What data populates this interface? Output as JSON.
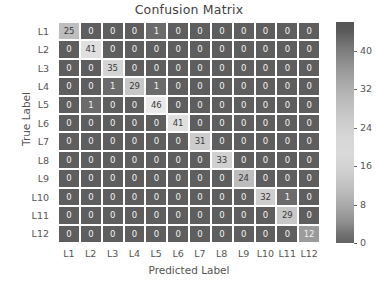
{
  "chart_data": {
    "type": "heatmap",
    "title": "Confusion Matrix",
    "xlabel": "Predicted Label",
    "ylabel": "True Label",
    "categories_x": [
      "L1",
      "L2",
      "L3",
      "L4",
      "L5",
      "L6",
      "L7",
      "L8",
      "L9",
      "L10",
      "L11",
      "L12"
    ],
    "categories_y": [
      "L1",
      "L2",
      "L3",
      "L4",
      "L5",
      "L6",
      "L7",
      "L8",
      "L9",
      "L10",
      "L11",
      "L12"
    ],
    "values": [
      [
        25,
        0,
        0,
        0,
        1,
        0,
        0,
        0,
        0,
        0,
        0,
        0
      ],
      [
        0,
        41,
        0,
        0,
        0,
        0,
        0,
        0,
        0,
        0,
        0,
        0
      ],
      [
        0,
        0,
        35,
        0,
        0,
        0,
        0,
        0,
        0,
        0,
        0,
        0
      ],
      [
        0,
        0,
        1,
        29,
        1,
        0,
        0,
        0,
        0,
        0,
        0,
        0
      ],
      [
        0,
        1,
        0,
        0,
        46,
        0,
        0,
        0,
        0,
        0,
        0,
        0
      ],
      [
        0,
        0,
        0,
        0,
        0,
        41,
        0,
        0,
        0,
        0,
        0,
        0
      ],
      [
        0,
        0,
        0,
        0,
        0,
        0,
        31,
        0,
        0,
        0,
        0,
        0
      ],
      [
        0,
        0,
        0,
        0,
        0,
        0,
        0,
        33,
        0,
        0,
        0,
        0
      ],
      [
        0,
        0,
        0,
        0,
        0,
        0,
        0,
        0,
        24,
        0,
        0,
        0
      ],
      [
        0,
        0,
        0,
        0,
        0,
        0,
        0,
        0,
        0,
        32,
        1,
        0
      ],
      [
        0,
        0,
        0,
        0,
        0,
        0,
        0,
        0,
        0,
        0,
        29,
        0
      ],
      [
        0,
        0,
        0,
        0,
        0,
        0,
        0,
        0,
        0,
        0,
        0,
        12
      ]
    ],
    "vmin": 0,
    "vmax": 46,
    "colorbar": {
      "ticks": [
        0,
        8,
        16,
        24,
        32,
        40
      ],
      "position": "right"
    },
    "colors": {
      "low_cell": "#5e5e5e",
      "high_cell": "#e8e8e8",
      "text_on_dark": "#f2f2f2",
      "text_on_light": "#3a3a3a",
      "grid_line": "#ffffff",
      "background": "#ffffff",
      "axis_text": "#555555"
    },
    "grid": true
  }
}
